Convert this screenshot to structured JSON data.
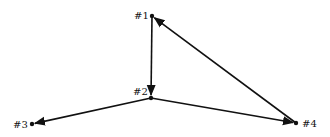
{
  "diagram": {
    "type": "directed-graph",
    "nodes": [
      {
        "id": "1",
        "label": "#1",
        "x": 152,
        "y": 16,
        "label_x": 134,
        "label_y": 19
      },
      {
        "id": "2",
        "label": "#2",
        "x": 151,
        "y": 98,
        "label_x": 133,
        "label_y": 95
      },
      {
        "id": "3",
        "label": "#3",
        "x": 32,
        "y": 124,
        "label_x": 13,
        "label_y": 128
      },
      {
        "id": "4",
        "label": "#4",
        "x": 296,
        "y": 123,
        "label_x": 302,
        "label_y": 127
      }
    ],
    "edges": [
      {
        "from": "1",
        "to": "2"
      },
      {
        "from": "2",
        "to": "3"
      },
      {
        "from": "2",
        "to": "4"
      },
      {
        "from": "4",
        "to": "1"
      }
    ],
    "colors": {
      "stroke": "#111111",
      "background": "#ffffff"
    }
  }
}
